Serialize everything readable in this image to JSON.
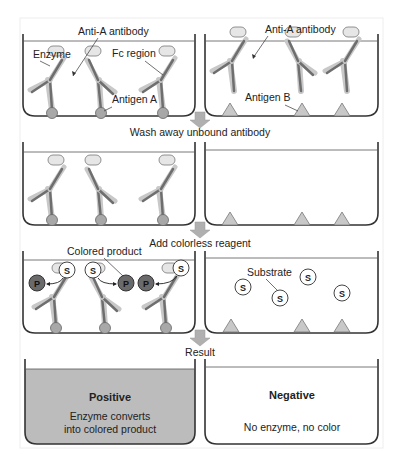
{
  "diagram": {
    "type": "ELISA specificity illustration",
    "colors": {
      "well_line": "#333333",
      "antibody_dark": "#6e6e6e",
      "antibody_light": "#c8c8c8",
      "antigen_a": "#a8a8a8",
      "antigen_b": "#c8c8c8",
      "enzyme": "#e6e6e6",
      "product": "#6a6a6a",
      "arrow": "#b0b0b0",
      "positive_fill": "#bcbcbc"
    },
    "row1": {
      "left": {
        "labels": {
          "antibody": "Anti-A antibody",
          "enzyme": "Enzyme",
          "fc_region": "Fc region",
          "antigen": "Antigen A"
        }
      },
      "right": {
        "labels": {
          "antibody": "Anti-A antibody",
          "antigen": "Antigen B"
        }
      }
    },
    "steps": [
      {
        "label": "Wash away unbound antibody"
      },
      {
        "label": "Add colorless reagent"
      },
      {
        "label": "Result"
      }
    ],
    "row3": {
      "left": {
        "labels": {
          "product": "Colored product"
        },
        "substrate_symbol": "S",
        "product_symbol": "P"
      },
      "right": {
        "labels": {
          "substrate": "Substrate"
        },
        "substrate_symbol": "S"
      }
    },
    "row4": {
      "left": {
        "title": "Positive",
        "line1": "Enzyme converts",
        "line2": "into colored product"
      },
      "right": {
        "title": "Negative",
        "line1": "No enzyme, no color"
      }
    }
  }
}
